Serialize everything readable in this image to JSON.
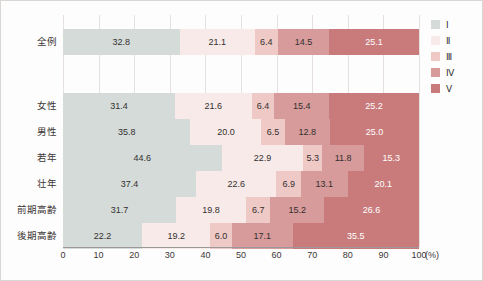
{
  "chart_data": {
    "type": "bar",
    "orientation": "horizontal",
    "stacked": true,
    "normalized_percent": true,
    "title": "",
    "xlabel": "(%)",
    "ylabel": "",
    "xlim": [
      0,
      100
    ],
    "xticks": [
      0,
      10,
      20,
      30,
      40,
      50,
      60,
      70,
      80,
      90,
      100
    ],
    "grid": "vertical",
    "legend_position": "right",
    "categories": [
      "全例",
      "女性",
      "男性",
      "若年",
      "壮年",
      "前期高齢",
      "後期高齢"
    ],
    "series": [
      {
        "name": "Ⅰ",
        "color": "#d5dbd9",
        "values": [
          32.8,
          31.4,
          35.8,
          44.6,
          37.4,
          31.7,
          22.2
        ]
      },
      {
        "name": "Ⅱ",
        "color": "#f8eae8",
        "values": [
          21.1,
          21.6,
          20.0,
          22.9,
          22.6,
          19.8,
          19.2
        ]
      },
      {
        "name": "Ⅲ",
        "color": "#eec9c6",
        "values": [
          6.4,
          6.4,
          6.5,
          5.3,
          6.9,
          6.7,
          6.0
        ]
      },
      {
        "name": "Ⅳ",
        "color": "#d79b9b",
        "values": [
          14.5,
          15.4,
          12.8,
          11.8,
          13.1,
          15.2,
          17.1
        ]
      },
      {
        "name": "Ⅴ",
        "color": "#c97b7b",
        "values": [
          25.1,
          25.2,
          25.0,
          15.3,
          20.1,
          26.6,
          35.5
        ]
      }
    ],
    "value_label_text_color_by_series": [
      "dark",
      "dark",
      "dark",
      "dark",
      "light"
    ]
  },
  "legend": {
    "items": [
      {
        "label": "Ⅰ",
        "color": "#d5dbd9"
      },
      {
        "label": "Ⅱ",
        "color": "#f8eae8"
      },
      {
        "label": "Ⅲ",
        "color": "#eec9c6"
      },
      {
        "label": "Ⅳ",
        "color": "#d79b9b"
      },
      {
        "label": "Ⅴ",
        "color": "#c97b7b"
      }
    ]
  },
  "axis": {
    "x_unit": "(%)",
    "x_tick_labels": [
      "0",
      "10",
      "20",
      "30",
      "40",
      "50",
      "60",
      "70",
      "80",
      "90",
      "100"
    ]
  }
}
